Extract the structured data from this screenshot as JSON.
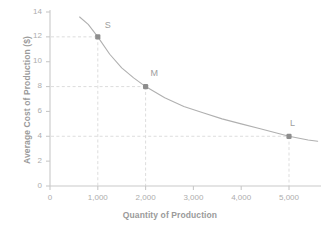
{
  "chart_data": {
    "type": "line",
    "title": "",
    "xlabel": "Quantity of Production",
    "ylabel": "Average Cost of Production ($)",
    "xlim": [
      0,
      5600
    ],
    "ylim": [
      0,
      14
    ],
    "grid": false,
    "x_ticks": [
      {
        "value": 0,
        "label": "0"
      },
      {
        "value": 1000,
        "label": "1,000"
      },
      {
        "value": 2000,
        "label": "2,000"
      },
      {
        "value": 3000,
        "label": "3,000"
      },
      {
        "value": 4000,
        "label": "4,000"
      },
      {
        "value": 5000,
        "label": "5,000"
      }
    ],
    "y_ticks": [
      {
        "value": 0,
        "label": "0"
      },
      {
        "value": 2,
        "label": "2"
      },
      {
        "value": 4,
        "label": "4"
      },
      {
        "value": 6,
        "label": "6"
      },
      {
        "value": 8,
        "label": "8"
      },
      {
        "value": 10,
        "label": "10"
      },
      {
        "value": 12,
        "label": "12"
      },
      {
        "value": 14,
        "label": "14"
      }
    ],
    "series": [
      {
        "name": "Average cost curve",
        "x": [
          620,
          800,
          1000,
          1250,
          1500,
          1750,
          2000,
          2400,
          2800,
          3200,
          3600,
          4000,
          4400,
          4800,
          5000,
          5400,
          5600
        ],
        "y": [
          13.6,
          13.0,
          12.0,
          10.6,
          9.5,
          8.7,
          8.0,
          7.1,
          6.4,
          5.9,
          5.4,
          5.0,
          4.6,
          4.2,
          4.0,
          3.7,
          3.6
        ]
      }
    ],
    "points": [
      {
        "label": "S",
        "x": 1000,
        "y": 12
      },
      {
        "label": "M",
        "x": 2000,
        "y": 8
      },
      {
        "label": "L",
        "x": 5000,
        "y": 4
      }
    ],
    "colors": {
      "curve": "#b0b0b0",
      "marker": "#8e8e8e",
      "axis": "#c9c9c9",
      "guide": "#d9d9d9",
      "tick_text": "#adadad",
      "axis_title": "#9a9a9a",
      "background": "#ffffff"
    }
  }
}
